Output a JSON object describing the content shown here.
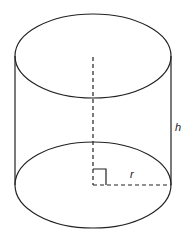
{
  "diagram": {
    "labels": {
      "height": "h",
      "radius": "r"
    },
    "colors": {
      "stroke": "#222222",
      "background": "#ffffff"
    }
  }
}
